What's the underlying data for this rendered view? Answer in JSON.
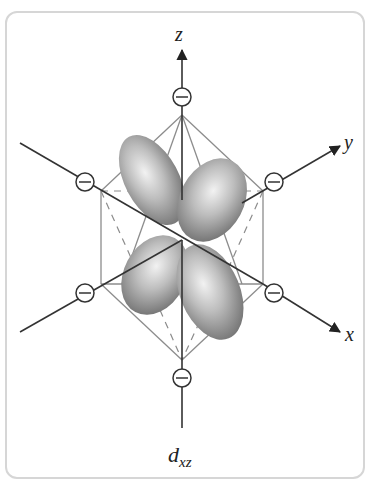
{
  "diagram": {
    "caption": {
      "main": "d",
      "subscript": "xz"
    },
    "axes": [
      {
        "name": "z",
        "label": "z"
      },
      {
        "name": "y",
        "label": "y"
      },
      {
        "name": "x",
        "label": "x"
      }
    ],
    "ligands": {
      "count": 6,
      "charge_symbol": "−",
      "positions": [
        "top",
        "upper-left",
        "upper-right",
        "lower-left",
        "lower-right",
        "bottom"
      ]
    },
    "orbital": {
      "type": "d_xz",
      "lobe_count": 4,
      "lobe_color": "#9a9a9a"
    },
    "colors": {
      "axis_line": "#333333",
      "octahedron_edge": "#8c8c8c",
      "frame_border": "#d6d6d6"
    }
  }
}
